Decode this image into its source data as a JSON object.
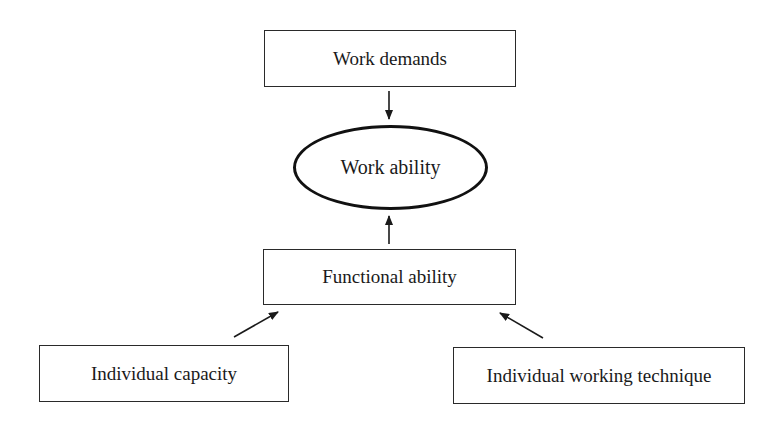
{
  "diagram": {
    "nodes": {
      "work_demands": {
        "label": "Work demands",
        "shape": "rectangle"
      },
      "work_ability": {
        "label": "Work ability",
        "shape": "ellipse"
      },
      "functional_ability": {
        "label": "Functional ability",
        "shape": "rectangle"
      },
      "individual_capacity": {
        "label": "Individual capacity",
        "shape": "rectangle"
      },
      "individual_working_technique": {
        "label": "Individual working technique",
        "shape": "rectangle"
      }
    },
    "edges": [
      {
        "from": "work_demands",
        "to": "work_ability"
      },
      {
        "from": "functional_ability",
        "to": "work_ability"
      },
      {
        "from": "individual_capacity",
        "to": "functional_ability"
      },
      {
        "from": "individual_working_technique",
        "to": "functional_ability"
      }
    ],
    "colors": {
      "stroke": "#2a2a2a",
      "background": "#ffffff",
      "text": "#1a1a1a"
    }
  }
}
